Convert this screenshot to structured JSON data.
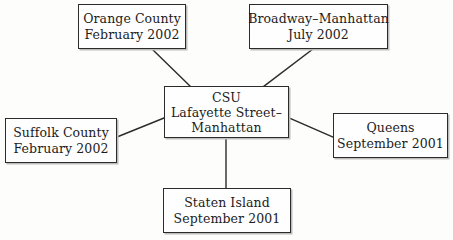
{
  "diagram": {
    "type": "hub-and-spoke network diagram",
    "background_color": "#fdfdfc",
    "border_color": "#2b2b2b",
    "text_color": "#1c1c1c",
    "edge_color": "#2b2b2b",
    "center": {
      "id": "csu-center",
      "lines": [
        "CSU",
        "Lafayette Street–",
        "Manhattan"
      ]
    },
    "nodes": [
      {
        "id": "orange-county",
        "position": "top-left",
        "lines": [
          "Orange County",
          "February 2002"
        ],
        "place": "Orange County",
        "date": "February 2002"
      },
      {
        "id": "broadway-manhattan",
        "position": "top-right",
        "lines": [
          "Broadway–Manhattan",
          "July 2002"
        ],
        "place": "Broadway–Manhattan",
        "date": "July 2002"
      },
      {
        "id": "suffolk-county",
        "position": "left",
        "lines": [
          "Suffolk County",
          "February 2002"
        ],
        "place": "Suffolk County",
        "date": "February 2002"
      },
      {
        "id": "queens",
        "position": "right",
        "lines": [
          "Queens",
          "September 2001"
        ],
        "place": "Queens",
        "date": "September 2001"
      },
      {
        "id": "staten-island",
        "position": "bottom",
        "lines": [
          "Staten Island",
          "September 2001"
        ],
        "place": "Staten Island",
        "date": "September 2001"
      }
    ],
    "edges": [
      {
        "from": "orange-county",
        "to": "csu-center"
      },
      {
        "from": "broadway-manhattan",
        "to": "csu-center"
      },
      {
        "from": "suffolk-county",
        "to": "csu-center"
      },
      {
        "from": "queens",
        "to": "csu-center"
      },
      {
        "from": "staten-island",
        "to": "csu-center"
      }
    ]
  }
}
